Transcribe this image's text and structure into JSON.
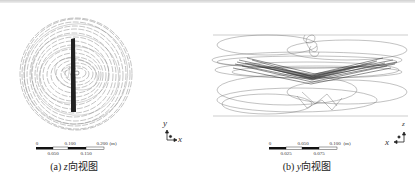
{
  "figure": {
    "panels": [
      {
        "id": "a",
        "caption_prefix": "(a) ",
        "caption_axis": "z",
        "caption_suffix": "向视图",
        "scale_bar": {
          "top_labels": [
            "0",
            "0.100",
            "0.200",
            "(m)"
          ],
          "bottom_labels": [
            "0.050",
            "0.150"
          ]
        },
        "triad": {
          "vertical": "y",
          "horizontal": "x"
        }
      },
      {
        "id": "b",
        "caption_prefix": "(b) ",
        "caption_axis": "y",
        "caption_suffix": "向视图",
        "scale_bar": {
          "top_labels": [
            "0",
            "0.050",
            "0.100",
            "(m)"
          ],
          "bottom_labels": [
            "0.025",
            "0.075"
          ]
        },
        "triad": {
          "vertical": "z",
          "horizontal": "x"
        }
      }
    ]
  }
}
